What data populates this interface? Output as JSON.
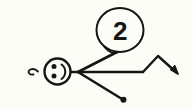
{
  "canvas": {
    "width": 193,
    "height": 110,
    "background_color": "#fdfdf8",
    "ink_color": "#161512",
    "title": "hand-drawn stick-figure sketch"
  },
  "annotation": {
    "number_label": "2"
  },
  "elements": {
    "face_circle": {
      "name": "smiley face head",
      "cx": 57.5,
      "cy": 71.5,
      "r": 13.0,
      "stroke_width": 2.4
    },
    "face_eye_upper": {
      "cx": 54.0,
      "cy": 66.5,
      "r": 2.5
    },
    "face_eye_lower": {
      "cx": 54.0,
      "cy": 76.0,
      "r": 2.5
    },
    "face_smile": {
      "name": "smile arc rotated ninety degrees",
      "path": "M 61.5 64.5 C 66.5 68.0 66.5 75.5 61.5 79.0",
      "stroke_width": 2.0
    },
    "left_hook": {
      "name": "small curled tail on left",
      "path": "M 33.5 74.5 C 28.5 75.5 27.0 71.0 30.5 69.5 C 33.5 68.3 36.5 70.0 38.0 71.5",
      "stroke_width": 1.8
    },
    "junction": {
      "x": 78.0,
      "y": 72.0
    },
    "arm_upper": {
      "name": "upper diagonal arm to callout circle",
      "x1": 78.0,
      "y1": 72.0,
      "x2": 117.0,
      "y2": 52.0,
      "stroke_width": 2.6
    },
    "arm_lower": {
      "name": "lower diagonal arm ending in blob",
      "x1": 78.0,
      "y1": 72.0,
      "x2": 122.0,
      "y2": 99.0,
      "stroke_width": 2.6
    },
    "arm_lower_blob": {
      "cx": 123.5,
      "cy": 99.8,
      "r": 3.0
    },
    "spine": {
      "name": "horizontal line from head through junction",
      "x1": 70.0,
      "y1": 72.0,
      "x2": 143.0,
      "y2": 72.0,
      "stroke_width": 2.4
    },
    "zigzag": {
      "name": "zigzag leg ending in arrowhead",
      "points": "143,72 158,56 177,73",
      "stroke_width": 2.4
    },
    "arrow_head": {
      "name": "arrowhead barb at zigzag end",
      "path": "M 170.5 70.0 L 178.5 74.5 L 175.0 65.5 Z"
    },
    "callout_circle": {
      "name": "circle enclosing number two",
      "cx": 120.0,
      "cy": 30.0,
      "rx": 23.5,
      "ry": 22.0,
      "stroke_width": 2.0
    },
    "callout_tail": {
      "name": "tail from callout circle toward arm",
      "path": "M 104.0 46.5 C 108.0 51.5 113.0 54.0 117.5 52.5",
      "stroke_width": 1.8
    },
    "number_text_pos": {
      "x": 120.0,
      "y": 31.0
    }
  }
}
